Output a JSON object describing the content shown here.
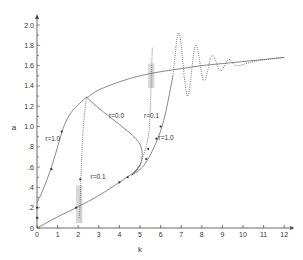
{
  "chart_data": {
    "type": "line",
    "title": "",
    "xlabel": "k",
    "ylabel": "a",
    "xlim": [
      0,
      12
    ],
    "ylim": [
      0,
      2.0
    ],
    "x_ticks": [
      "0",
      "1",
      "2",
      "3",
      "4",
      "5",
      "6",
      "7",
      "8",
      "9",
      "10",
      "11",
      "12"
    ],
    "y_ticks": [
      "0",
      ".2",
      ".4",
      ".6",
      ".8",
      "1.0",
      "1.2",
      "1.4",
      "1.6",
      "1.8",
      "2.0"
    ],
    "grid": false,
    "legend": "none (inline labels)",
    "annotations": [
      {
        "text": "r=1.0",
        "x": 0.4,
        "y": 0.86
      },
      {
        "text": "r=0.1",
        "x": 2.6,
        "y": 0.48
      },
      {
        "text": "r=0.0",
        "x": 3.5,
        "y": 1.08
      },
      {
        "text": "r=0.1",
        "x": 5.2,
        "y": 1.08
      },
      {
        "text": "r=1.0",
        "x": 5.9,
        "y": 0.87
      }
    ],
    "series": [
      {
        "name": "upper branch (solid)",
        "style": "solid",
        "points": [
          [
            2.4,
            1.28
          ],
          [
            3,
            1.36
          ],
          [
            4,
            1.44
          ],
          [
            5,
            1.5
          ],
          [
            6,
            1.54
          ],
          [
            7,
            1.57
          ],
          [
            8,
            1.6
          ],
          [
            9,
            1.62
          ],
          [
            10,
            1.64
          ],
          [
            11,
            1.66
          ],
          [
            12,
            1.68
          ]
        ]
      },
      {
        "name": "lower branch (solid)",
        "style": "solid",
        "points": [
          [
            0,
            0
          ],
          [
            1,
            0.11
          ],
          [
            2,
            0.21
          ],
          [
            3,
            0.32
          ],
          [
            4,
            0.45
          ],
          [
            4.7,
            0.55
          ],
          [
            5.0,
            0.62
          ]
        ]
      },
      {
        "name": "r=0.0 backbone loop",
        "style": "solid",
        "points": [
          [
            2.4,
            1.29
          ],
          [
            3,
            1.18
          ],
          [
            4,
            1.02
          ],
          [
            4.8,
            0.88
          ],
          [
            5.1,
            0.76
          ],
          [
            5.0,
            0.62
          ],
          [
            4.6,
            0.52
          ]
        ]
      },
      {
        "name": "r=1.0 left curve",
        "style": "solid",
        "points": [
          [
            0,
            0.25
          ],
          [
            0.3,
            0.38
          ],
          [
            0.7,
            0.6
          ],
          [
            1.0,
            0.8
          ],
          [
            1.3,
            1.0
          ],
          [
            1.7,
            1.15
          ],
          [
            2.4,
            1.29
          ]
        ]
      },
      {
        "name": "r=0.1 left jump",
        "style": "dotted",
        "points": [
          [
            2.4,
            1.29
          ],
          [
            2.25,
            1.0
          ],
          [
            2.15,
            0.6
          ],
          [
            2.1,
            0.3
          ],
          [
            2.05,
            0.1
          ]
        ]
      },
      {
        "name": "r=0.1 right jump",
        "style": "dotted",
        "points": [
          [
            4.6,
            0.52
          ],
          [
            5.0,
            0.62
          ],
          [
            5.4,
            0.9
          ],
          [
            5.5,
            1.2
          ],
          [
            5.55,
            1.5
          ],
          [
            5.6,
            1.78
          ]
        ]
      },
      {
        "name": "r=1.0 right curve",
        "style": "solid",
        "points": [
          [
            4.6,
            0.52
          ],
          [
            5.2,
            0.62
          ],
          [
            5.8,
            0.85
          ],
          [
            6.2,
            1.1
          ],
          [
            6.6,
            1.5
          ]
        ]
      },
      {
        "name": "decaying oscillation (dotted)",
        "style": "dotted",
        "points": [
          [
            6.6,
            1.5
          ],
          [
            6.9,
            1.92
          ],
          [
            7.3,
            1.3
          ],
          [
            7.7,
            1.8
          ],
          [
            8.1,
            1.45
          ],
          [
            8.5,
            1.7
          ],
          [
            8.9,
            1.55
          ],
          [
            9.3,
            1.66
          ],
          [
            9.7,
            1.6
          ],
          [
            10.5,
            1.64
          ],
          [
            11.5,
            1.67
          ],
          [
            12,
            1.68
          ]
        ]
      }
    ]
  }
}
